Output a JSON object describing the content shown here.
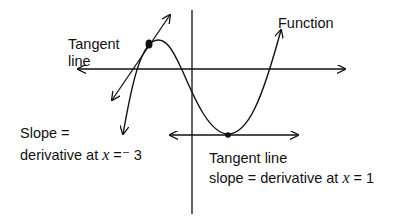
{
  "diagram": {
    "title": "",
    "labels": {
      "function": "Function",
      "tangent_line_1": "Tangent",
      "tangent_line_2": "line",
      "slope_line1": "Slope =",
      "slope_line2_prefix": "derivative at ",
      "slope_line2_var": "x",
      "slope_line2_suffix": " =⁻ 3",
      "tangent2_line1": "Tangent line",
      "tangent2_line2_prefix": "slope = derivative at ",
      "tangent2_line2_var": "x",
      "tangent2_line2_suffix": " = 1"
    },
    "points": [
      {
        "name": "tangent-point-x-neg3",
        "x": -3
      },
      {
        "name": "tangent-point-x-1",
        "x": 1
      }
    ],
    "colors": {
      "stroke": "#111111",
      "background": "#ffffff"
    }
  }
}
